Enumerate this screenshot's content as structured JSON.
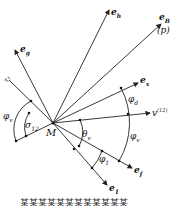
{
  "labels": {
    "e_h": "e",
    "e_h_sub": "h",
    "e_B": "e",
    "e_B_sub": "B",
    "p": "(p)",
    "e_g": "e",
    "e_g_sub": "g",
    "tau": "τ₁",
    "e_x": "e",
    "e_x_sub": "x",
    "phi_d": "φ",
    "phi_d_sub": "d",
    "v12": "v",
    "v12_sup": "(12)",
    "phi_v_left": "φ",
    "phi_v_left_sub": "v",
    "sigma12": "σ",
    "sigma12_sub": "12",
    "M": "M",
    "theta_v": "θ",
    "theta_v_sub": "v",
    "phi_v_right": "φ",
    "phi_v_right_sub": "v",
    "phi1": "φ",
    "phi1_sub": "1",
    "e_f": "e",
    "e_f_sub": "f",
    "e1": "e",
    "e1_sub": "1"
  },
  "caption": "某某某某某某某某某某某某"
}
